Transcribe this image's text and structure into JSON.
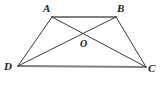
{
  "figure": {
    "kind": "trapezoid-with-diagonals",
    "background_color": "#ffffff",
    "stroke_color_sides": "#808080",
    "stroke_color_legs": "#3a3a3a",
    "stroke_color_diagonals": "#3a3a3a",
    "label_color": "#1a1a1a",
    "vertices": [
      {
        "name": "A",
        "label": "A",
        "x": 52,
        "y": 17
      },
      {
        "name": "B",
        "label": "B",
        "x": 116,
        "y": 17
      },
      {
        "name": "C",
        "label": "C",
        "x": 146,
        "y": 67
      },
      {
        "name": "D",
        "label": "D",
        "x": 18,
        "y": 66
      },
      {
        "name": "O",
        "label": "O",
        "x": 84,
        "y": 33
      }
    ],
    "segments": [
      {
        "name": "side-AB",
        "from": "A",
        "to": "B",
        "x1": 52,
        "y1": 17,
        "x2": 116,
        "y2": 17,
        "color": "#808080",
        "width": 2.1
      },
      {
        "name": "side-DC",
        "from": "D",
        "to": "C",
        "x1": 18,
        "y1": 66,
        "x2": 146,
        "y2": 67,
        "color": "#808080",
        "width": 2.1
      },
      {
        "name": "leg-AD",
        "from": "A",
        "to": "D",
        "x1": 52,
        "y1": 17,
        "x2": 18,
        "y2": 66,
        "color": "#3a3a3a",
        "width": 1
      },
      {
        "name": "leg-BC",
        "from": "B",
        "to": "C",
        "x1": 116,
        "y1": 17,
        "x2": 146,
        "y2": 67,
        "color": "#3a3a3a",
        "width": 1
      },
      {
        "name": "diagonal-AC",
        "from": "A",
        "to": "C",
        "x1": 52,
        "y1": 17,
        "x2": 146,
        "y2": 67,
        "color": "#3a3a3a",
        "width": 1
      },
      {
        "name": "diagonal-BD",
        "from": "B",
        "to": "D",
        "x1": 116,
        "y1": 17,
        "x2": 18,
        "y2": 66,
        "color": "#3a3a3a",
        "width": 1
      }
    ]
  }
}
